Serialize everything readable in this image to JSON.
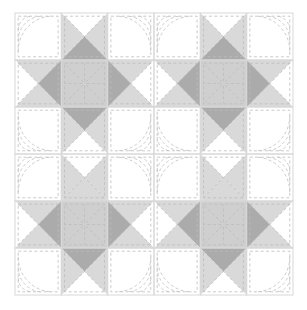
{
  "figure": {
    "kind": "quilt-block-diagram",
    "canvas": {
      "width": 307,
      "height": 310,
      "background": "#ffffff"
    },
    "grid": {
      "columns": 6,
      "rows": 6,
      "origin_x": 15,
      "origin_y": 13,
      "cell_width": 46.33,
      "cell_height": 47.0,
      "border_color": "#d8d8d8",
      "border_width": 1
    },
    "palette": {
      "white": "#ffffff",
      "light_gray": "#d9d9d9",
      "mid_gray": "#cfcfcf",
      "dark_gray": "#ababab",
      "stitch": "#bdbdbd",
      "seam": "#d0d0d0"
    },
    "stitch": {
      "color": "#bdbdbd",
      "width": 0.8,
      "dash": "3 2.4"
    },
    "legend": [
      {
        "swatch_name": "background-patch",
        "label": "Background (white)",
        "color": "#ffffff"
      },
      {
        "swatch_name": "light-patch",
        "label": "Light value fabric",
        "color": "#d9d9d9"
      },
      {
        "swatch_name": "dark-patch",
        "label": "Dark value fabric",
        "color": "#ababab"
      }
    ],
    "cells": [
      {
        "r": 0,
        "c": 0,
        "type": "plain",
        "fill": "white",
        "quilt": "arcs-tl"
      },
      {
        "r": 0,
        "c": 1,
        "type": "qst",
        "quilt": "cross-diag",
        "top": "white",
        "right": "light_gray",
        "bottom": "dark_gray",
        "left": "light_gray"
      },
      {
        "r": 0,
        "c": 2,
        "type": "plain",
        "fill": "white",
        "quilt": "arcs-tr"
      },
      {
        "r": 0,
        "c": 3,
        "type": "plain",
        "fill": "white",
        "quilt": "arcs-tl"
      },
      {
        "r": 0,
        "c": 4,
        "type": "qst",
        "quilt": "cross-diag",
        "top": "white",
        "right": "light_gray",
        "bottom": "dark_gray",
        "left": "light_gray"
      },
      {
        "r": 0,
        "c": 5,
        "type": "plain",
        "fill": "white",
        "quilt": "arcs-tr"
      },
      {
        "r": 1,
        "c": 0,
        "type": "qst",
        "quilt": "cross-diag",
        "top": "light_gray",
        "right": "dark_gray",
        "bottom": "light_gray",
        "left": "white"
      },
      {
        "r": 1,
        "c": 1,
        "type": "star",
        "fill": "mid_gray",
        "quilt": "starburst"
      },
      {
        "r": 1,
        "c": 2,
        "type": "qst",
        "quilt": "cross-diag",
        "top": "light_gray",
        "right": "white",
        "bottom": "light_gray",
        "left": "dark_gray"
      },
      {
        "r": 1,
        "c": 3,
        "type": "qst",
        "quilt": "cross-diag",
        "top": "light_gray",
        "right": "dark_gray",
        "bottom": "light_gray",
        "left": "white"
      },
      {
        "r": 1,
        "c": 4,
        "type": "star",
        "fill": "mid_gray",
        "quilt": "starburst"
      },
      {
        "r": 1,
        "c": 5,
        "type": "qst",
        "quilt": "cross-diag",
        "top": "light_gray",
        "right": "white",
        "bottom": "light_gray",
        "left": "dark_gray"
      },
      {
        "r": 2,
        "c": 0,
        "type": "plain",
        "fill": "white",
        "quilt": "arcs-bl"
      },
      {
        "r": 2,
        "c": 1,
        "type": "qst",
        "quilt": "cross-diag",
        "top": "dark_gray",
        "right": "light_gray",
        "bottom": "white",
        "left": "light_gray"
      },
      {
        "r": 2,
        "c": 2,
        "type": "plain",
        "fill": "white",
        "quilt": "arcs-br"
      },
      {
        "r": 2,
        "c": 3,
        "type": "plain",
        "fill": "white",
        "quilt": "arcs-bl"
      },
      {
        "r": 2,
        "c": 4,
        "type": "qst",
        "quilt": "cross-diag",
        "top": "dark_gray",
        "right": "light_gray",
        "bottom": "white",
        "left": "light_gray"
      },
      {
        "r": 2,
        "c": 5,
        "type": "plain",
        "fill": "white",
        "quilt": "arcs-br"
      },
      {
        "r": 3,
        "c": 0,
        "type": "plain",
        "fill": "white",
        "quilt": "arcs-tl"
      },
      {
        "r": 3,
        "c": 1,
        "type": "qst",
        "quilt": "cross-diag",
        "top": "white",
        "right": "light_gray",
        "bottom": "light_gray",
        "left": "light_gray"
      },
      {
        "r": 3,
        "c": 2,
        "type": "plain",
        "fill": "white",
        "quilt": "arcs-tr"
      },
      {
        "r": 3,
        "c": 3,
        "type": "plain",
        "fill": "white",
        "quilt": "arcs-tl"
      },
      {
        "r": 3,
        "c": 4,
        "type": "qst",
        "quilt": "cross-diag",
        "top": "white",
        "right": "light_gray",
        "bottom": "light_gray",
        "left": "light_gray"
      },
      {
        "r": 3,
        "c": 5,
        "type": "plain",
        "fill": "white",
        "quilt": "arcs-tr"
      },
      {
        "r": 4,
        "c": 0,
        "type": "qst",
        "quilt": "cross-diag",
        "top": "light_gray",
        "right": "dark_gray",
        "bottom": "light_gray",
        "left": "white"
      },
      {
        "r": 4,
        "c": 1,
        "type": "star",
        "fill": "mid_gray",
        "quilt": "starburst"
      },
      {
        "r": 4,
        "c": 2,
        "type": "qst",
        "quilt": "cross-diag",
        "top": "light_gray",
        "right": "white",
        "bottom": "light_gray",
        "left": "dark_gray"
      },
      {
        "r": 4,
        "c": 3,
        "type": "qst",
        "quilt": "cross-diag",
        "top": "light_gray",
        "right": "dark_gray",
        "bottom": "light_gray",
        "left": "white"
      },
      {
        "r": 4,
        "c": 4,
        "type": "star",
        "fill": "mid_gray",
        "quilt": "starburst"
      },
      {
        "r": 4,
        "c": 5,
        "type": "qst",
        "quilt": "cross-diag",
        "top": "light_gray",
        "right": "white",
        "bottom": "light_gray",
        "left": "dark_gray"
      },
      {
        "r": 5,
        "c": 0,
        "type": "plain",
        "fill": "white",
        "quilt": "arcs-bl"
      },
      {
        "r": 5,
        "c": 1,
        "type": "qst",
        "quilt": "cross-diag",
        "top": "dark_gray",
        "right": "light_gray",
        "bottom": "white",
        "left": "light_gray"
      },
      {
        "r": 5,
        "c": 2,
        "type": "plain",
        "fill": "white",
        "quilt": "arcs-br"
      },
      {
        "r": 5,
        "c": 3,
        "type": "plain",
        "fill": "white",
        "quilt": "arcs-bl"
      },
      {
        "r": 5,
        "c": 4,
        "type": "qst",
        "quilt": "cross-diag",
        "top": "dark_gray",
        "right": "light_gray",
        "bottom": "white",
        "left": "light_gray"
      },
      {
        "r": 5,
        "c": 5,
        "type": "plain",
        "fill": "white",
        "quilt": "arcs-br"
      }
    ]
  }
}
